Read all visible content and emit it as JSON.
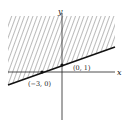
{
  "diagram": {
    "type": "linear-inequality-graph",
    "axes": {
      "x_label": "x",
      "y_label": "y"
    },
    "boundary_line": {
      "style": "solid",
      "points": [
        {
          "label": "(−3, 0)",
          "x": -3,
          "y": 0
        },
        {
          "label": "(0, 1)",
          "x": 0,
          "y": 1
        }
      ]
    },
    "shaded_region": "above the line",
    "colors": {
      "line": "#111111",
      "hatch": "#555555",
      "background": "#ffffff"
    }
  }
}
